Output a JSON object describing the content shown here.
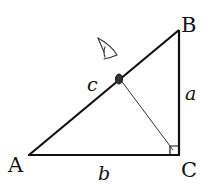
{
  "diagram": {
    "type": "right-triangle",
    "vertices": {
      "A": {
        "label": "A"
      },
      "B": {
        "label": "B"
      },
      "C": {
        "label": "C"
      }
    },
    "sides": {
      "a": {
        "label": "a",
        "between": "B-C"
      },
      "b": {
        "label": "b",
        "between": "A-C"
      },
      "c": {
        "label": "c",
        "between": "A-B"
      }
    },
    "right_angle_at": "C",
    "extras": {
      "cevian": "line from point on hypotenuse AB to C",
      "eye_sketch": "hand-drawn eye symbol above hypotenuse"
    },
    "colors": {
      "stroke": "#111111",
      "background": "#ffffff"
    }
  }
}
